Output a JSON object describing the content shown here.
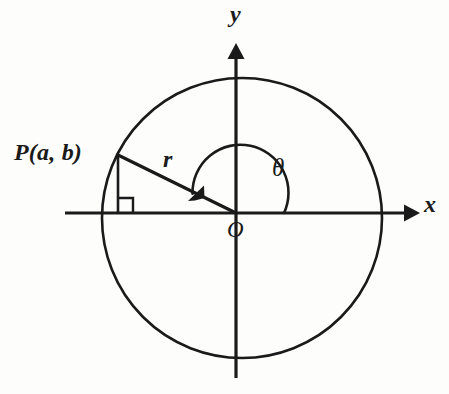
{
  "figure": {
    "kind": "unit-circle-trigonometry-diagram",
    "background_color": "#fdfdfc",
    "stroke_color": "#1a1a1a"
  },
  "labels": {
    "point_label": "P(a, b)",
    "radius_label": "r",
    "angle_label": "θ",
    "origin_label": "O",
    "x_axis_label": "x",
    "y_axis_label": "y"
  },
  "geometry": {
    "origin": {
      "x": 236,
      "y": 213
    },
    "circle": {
      "cx": 242,
      "cy": 218,
      "r": 140
    },
    "point_P": {
      "x": 118,
      "y": 155
    },
    "foot_of_perpendicular": {
      "x": 118,
      "y": 213
    },
    "right_angle_marker_size": 15,
    "angle_arc_radius": 48,
    "angle_start_degrees": 0,
    "angle_end_degrees": 205,
    "x_axis": {
      "x_start": 65,
      "x_end": 418,
      "y": 213
    },
    "y_axis": {
      "x": 236,
      "y_top": 45,
      "y_bottom": 378
    }
  }
}
